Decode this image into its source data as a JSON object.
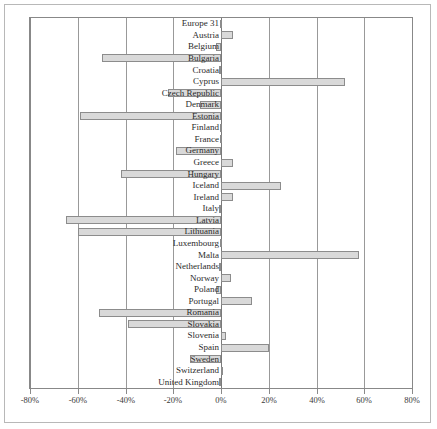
{
  "chart_data": {
    "type": "bar",
    "orientation": "horizontal",
    "title": "",
    "subtitle": "",
    "xlabel": "",
    "ylabel": "",
    "xlim": [
      -80,
      80
    ],
    "ylim": null,
    "grid": true,
    "legend": null,
    "xtick_labels": [
      "-80%",
      "-60%",
      "-40%",
      "-20%",
      "0%",
      "20%",
      "40%",
      "60%",
      "80%"
    ],
    "xtick_values": [
      -80,
      -60,
      -40,
      -20,
      0,
      20,
      40,
      60,
      80
    ],
    "categories": [
      "Europe 31",
      "Austria",
      "Belgium",
      "Bulgaria",
      "Croatia",
      "Cyprus",
      "Czech Republic",
      "Denmark",
      "Estonia",
      "Finland",
      "France",
      "Germany",
      "Greece",
      "Hungary",
      "Iceland",
      "Ireland",
      "Italy",
      "Latvia",
      "Lithuania",
      "Luxembourg",
      "Malta",
      "Netherlands",
      "Norway",
      "Poland",
      "Portugal",
      "Romania",
      "Slovakia",
      "Slovenia",
      "Spain",
      "Sweden",
      "Switzerland",
      "United Kingdom"
    ],
    "values": [
      -0.5,
      5,
      -2,
      -50,
      -1,
      52,
      -22,
      -9,
      -59,
      -0.5,
      -0.5,
      -19,
      5,
      -42,
      25,
      5,
      -1,
      -65,
      -60,
      -0.5,
      58,
      -1,
      4,
      -2,
      13,
      -51,
      -39,
      2,
      20,
      -13,
      1,
      -1
    ]
  },
  "bar_style": {
    "fill": "#d9d9d9",
    "stroke": "#8c8c8c"
  },
  "axis_style": {
    "gridline_color": "#999999",
    "frame_color": "#888888",
    "text_color": "#2b2b2b"
  }
}
